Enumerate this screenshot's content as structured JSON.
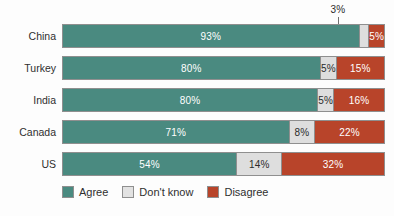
{
  "chart_data": {
    "type": "bar",
    "orientation": "horizontal",
    "stacked": true,
    "stack_total": 100,
    "unit": "%",
    "title": "",
    "subtitle": "",
    "xlabel": "",
    "ylabel": "",
    "xlim": [
      0,
      100
    ],
    "grid": false,
    "legend_position": "bottom-left",
    "categories": [
      "China",
      "Turkey",
      "India",
      "Canada",
      "US"
    ],
    "series": [
      {
        "name": "Agree",
        "color": "#4a8a80",
        "values": [
          93,
          80,
          80,
          71,
          54
        ]
      },
      {
        "name": "Don't know",
        "color": "#dedede",
        "values": [
          3,
          5,
          5,
          8,
          14
        ]
      },
      {
        "name": "Disagree",
        "color": "#b8442a",
        "values": [
          5,
          15,
          16,
          22,
          32
        ]
      }
    ],
    "annotations": [
      {
        "text": "3%",
        "target_category": "China",
        "target_series": "Don't know",
        "style": "leader-line-above"
      }
    ]
  },
  "callout": {
    "value": "3%"
  },
  "rows": [
    {
      "label": "China",
      "segments": [
        {
          "label": "93%",
          "value": 93,
          "show_label": true
        },
        {
          "label": "3%",
          "value": 3,
          "show_label": false
        },
        {
          "label": "5%",
          "value": 5,
          "show_label": true
        }
      ]
    },
    {
      "label": "Turkey",
      "segments": [
        {
          "label": "80%",
          "value": 80,
          "show_label": true
        },
        {
          "label": "5%",
          "value": 5,
          "show_label": true
        },
        {
          "label": "15%",
          "value": 15,
          "show_label": true
        }
      ]
    },
    {
      "label": "India",
      "segments": [
        {
          "label": "80%",
          "value": 80,
          "show_label": true
        },
        {
          "label": "5%",
          "value": 5,
          "show_label": true
        },
        {
          "label": "16%",
          "value": 16,
          "show_label": true
        }
      ]
    },
    {
      "label": "Canada",
      "segments": [
        {
          "label": "71%",
          "value": 71,
          "show_label": true
        },
        {
          "label": "8%",
          "value": 8,
          "show_label": true
        },
        {
          "label": "22%",
          "value": 22,
          "show_label": true
        }
      ]
    },
    {
      "label": "US",
      "segments": [
        {
          "label": "54%",
          "value": 54,
          "show_label": true
        },
        {
          "label": "14%",
          "value": 14,
          "show_label": true
        },
        {
          "label": "32%",
          "value": 32,
          "show_label": true
        }
      ]
    }
  ],
  "legend": {
    "items": [
      {
        "label": "Agree",
        "color": "#4a8a80"
      },
      {
        "label": "Don't know",
        "color": "#dedede"
      },
      {
        "label": "Disagree",
        "color": "#b8442a"
      }
    ]
  }
}
